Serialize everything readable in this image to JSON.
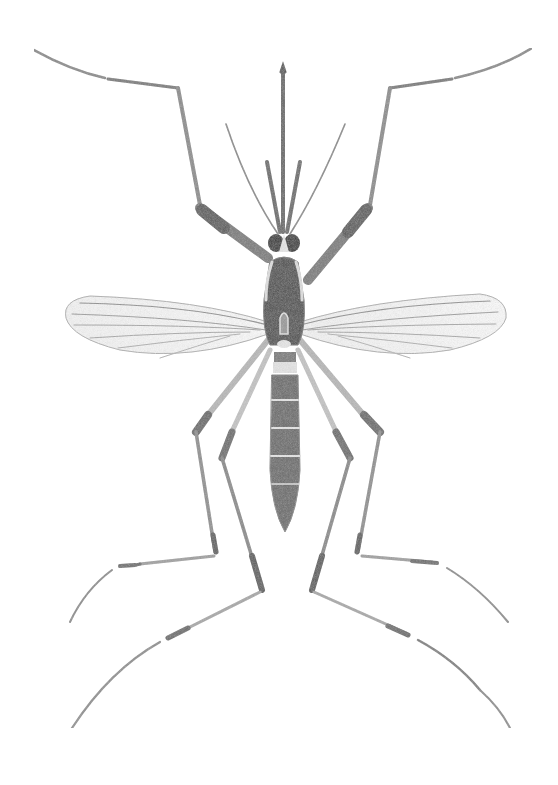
{
  "image": {
    "subject": "Mosquito (dorsal view) scientific illustration",
    "background": "#ffffff",
    "colors": {
      "ink_dark": "#3a3a3a",
      "ink_mid": "#6e6e6e",
      "ink_light": "#a8a8a8",
      "wing_vein": "#9a9a9a",
      "pale_band": "#e6e6e6"
    }
  }
}
